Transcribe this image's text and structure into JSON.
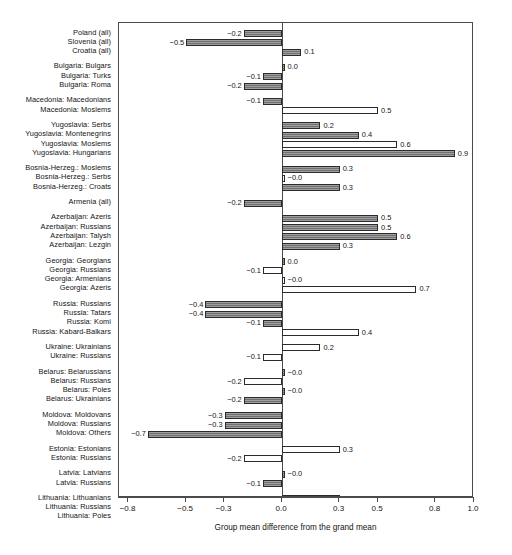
{
  "chart_data": {
    "type": "bar",
    "orientation": "horizontal",
    "title": "",
    "xlabel": "Group mean difference from the grand mean",
    "ylabel": "",
    "xlim": [
      -0.85,
      1.0
    ],
    "xticks": [
      -0.8,
      -0.5,
      -0.3,
      0.0,
      0.3,
      0.5,
      0.8,
      1.0
    ],
    "xtick_labels": [
      "-0.8",
      "-0.5",
      "-0.3",
      "0.0",
      "0.3",
      "0.5",
      "0.8",
      "1.0"
    ],
    "grid": false,
    "legend": "none",
    "reference_line": 0.0,
    "fill_styles": {
      "filled": "#7d7d7d",
      "open": "#ffffff",
      "border": "#2b2b2b"
    },
    "categories": [
      "Poland (all)",
      "Slovenia (all)",
      "Croatia (all)",
      "Bulgaria: Bulgars",
      "Bulgaria: Turks",
      "Bulgaria: Roma",
      "Macedonia: Macedonians",
      "Macedonia: Moslems",
      "Yugoslavia: Serbs",
      "Yugoslavia: Montenegrins",
      "Yugoslavia: Moslems",
      "Yugoslavia: Hungarians",
      "Bosnia-Herzeg.: Moslems",
      "Bosnia-Herzeg.: Serbs",
      "Bosnia-Herzeg.: Croats",
      "Armenia (all)",
      "Azerbaijan: Azeris",
      "Azerbaijan: Russians",
      "Azerbaijan: Talysh",
      "Azerbaijan: Lezgin",
      "Georgia: Georgians",
      "Georgia: Russians",
      "Georgia: Armenians",
      "Georgia: Azeris",
      "Russia: Russians",
      "Russia: Tatars",
      "Russia: Komi",
      "Russia: Kabard-Balkars",
      "Ukraine: Ukrainians",
      "Ukraine: Russians",
      "Belarus: Belarussians",
      "Belarus: Russians",
      "Belarus: Poles",
      "Belarus: Ukrainians",
      "Moldova: Moldovans",
      "Moldova: Russians",
      "Moldova: Others",
      "Estonia: Estonians",
      "Estonia: Russians",
      "Latvia: Latvians",
      "Latvia: Russians",
      "Lithuania: Lithuanians",
      "Lithuania: Russians",
      "Lithuania: Poles"
    ],
    "values": [
      -0.2,
      -0.5,
      0.1,
      0.0,
      -0.1,
      -0.2,
      -0.1,
      0.5,
      0.2,
      0.4,
      0.6,
      0.9,
      0.3,
      -0.0,
      0.3,
      -0.2,
      0.5,
      0.5,
      0.6,
      0.3,
      0.0,
      -0.1,
      -0.0,
      0.7,
      -0.4,
      -0.4,
      -0.1,
      0.4,
      0.2,
      -0.1,
      -0.0,
      -0.2,
      -0.0,
      -0.2,
      -0.3,
      -0.3,
      -0.7,
      0.3,
      -0.2,
      -0.0,
      -0.1,
      0.3,
      0.1,
      -0.4
    ],
    "value_labels": [
      "-0.2",
      "-0.5",
      "0.1",
      "0.0",
      "-0.1",
      "-0.2",
      "-0.1",
      "0.5",
      "0.2",
      "0.4",
      "0.6",
      "0.9",
      "0.3",
      "-0.0",
      "0.3",
      "-0.2",
      "0.5",
      "0.5",
      "0.6",
      "0.3",
      "0.0",
      "-0.1",
      "-0.0",
      "0.7",
      "-0.4",
      "-0.4",
      "-0.1",
      "0.4",
      "0.2",
      "-0.1",
      "-0.0",
      "-0.2",
      "-0.0",
      "-0.2",
      "-0.3",
      "-0.3",
      "-0.7",
      "0.3",
      "-0.2",
      "-0.0",
      "-0.1",
      "0.3",
      "0.1",
      "-0.4"
    ],
    "fills": [
      "filled",
      "filled",
      "filled",
      "filled",
      "filled",
      "filled",
      "filled",
      "open",
      "filled",
      "filled",
      "open",
      "filled",
      "filled",
      "open",
      "filled",
      "filled",
      "filled",
      "filled",
      "filled",
      "filled",
      "filled",
      "open",
      "open",
      "open",
      "filled",
      "filled",
      "filled",
      "open",
      "open",
      "open",
      "filled",
      "open",
      "filled",
      "filled",
      "filled",
      "filled",
      "filled",
      "open",
      "open",
      "filled",
      "filled",
      "filled",
      "filled",
      "open"
    ],
    "group_breaks_after": [
      2,
      5,
      7,
      11,
      14,
      15,
      19,
      23,
      27,
      29,
      33,
      36,
      38,
      40
    ]
  }
}
